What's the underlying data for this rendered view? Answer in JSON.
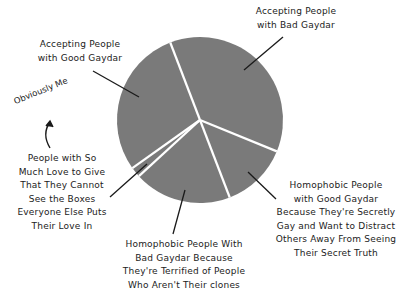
{
  "chart_data": {
    "type": "pie",
    "title": "",
    "center": [
      200,
      120
    ],
    "radius": 83,
    "start_angle_deg": 339,
    "slice_color": "#7a7a7a",
    "separator_color": "#ffffff",
    "slices": [
      {
        "label": "Accepting People with Bad Gaydar",
        "value": 37
      },
      {
        "label": "Homophobic People with Good Gaydar Because They're Secretly Gay and Want to Distract Others Away From Seeing Their Secret Truth",
        "value": 13
      },
      {
        "label": "Homophobic People With Bad Gaydar Because They're Terrified of People Who Aren't Their clones",
        "value": 19
      },
      {
        "label": "People with So Much Love to Give That They Cannot See the Boxes Everyone Else Puts Their Love In",
        "value": 2
      },
      {
        "label": "Accepting People with Good Gaydar",
        "value": 29
      }
    ],
    "annotations": [
      {
        "text": "Obviously Me",
        "points_to": "People with So Much Love to Give That They Cannot See the Boxes Everyone Else Puts Their Love In"
      }
    ]
  },
  "labels": {
    "accepting_good": [
      "Accepting People",
      "with Good Gaydar"
    ],
    "accepting_bad": [
      "Accepting People",
      "with Bad Gaydar"
    ],
    "homophobic_good": [
      "Homophobic People",
      "with Good Gaydar",
      "Because They're Secretly",
      "Gay and Want to Distract",
      "Others Away From Seeing",
      "Their Secret Truth"
    ],
    "homophobic_bad": [
      "Homophobic People With",
      "Bad Gaydar Because",
      "They're Terrified of People",
      "Who Aren't Their clones"
    ],
    "so_much_love": [
      "People with So",
      "Much Love to Give",
      "That They Cannot",
      "See the Boxes",
      "Everyone Else Puts",
      "Their Love In"
    ],
    "obviously_me": "Obviously Me"
  }
}
